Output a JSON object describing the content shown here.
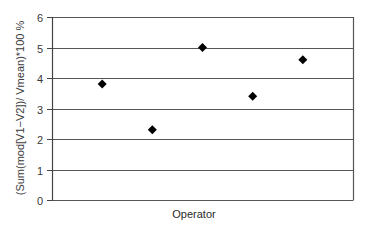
{
  "chart_data": {
    "type": "scatter",
    "title": "",
    "xlabel": "Operator",
    "ylabel": "(Sum(mod[V1−V2])/ Vmean)*100 %",
    "x": [
      1,
      2,
      3,
      4,
      5
    ],
    "series": [
      {
        "name": "",
        "marker": "diamond",
        "color": "#000000",
        "values": [
          3.8,
          2.3,
          5.0,
          3.4,
          4.6
        ]
      }
    ],
    "ylim": [
      0,
      6
    ],
    "yticks": [
      0,
      1,
      2,
      3,
      4,
      5,
      6
    ],
    "xlim": [
      0,
      6
    ],
    "xticks": [],
    "grid": {
      "horizontal": true,
      "vertical": false
    },
    "legend": null
  },
  "colors": {
    "gridline": "#555555",
    "axis": "#444444",
    "marker": "#000000",
    "background": "#ffffff"
  }
}
